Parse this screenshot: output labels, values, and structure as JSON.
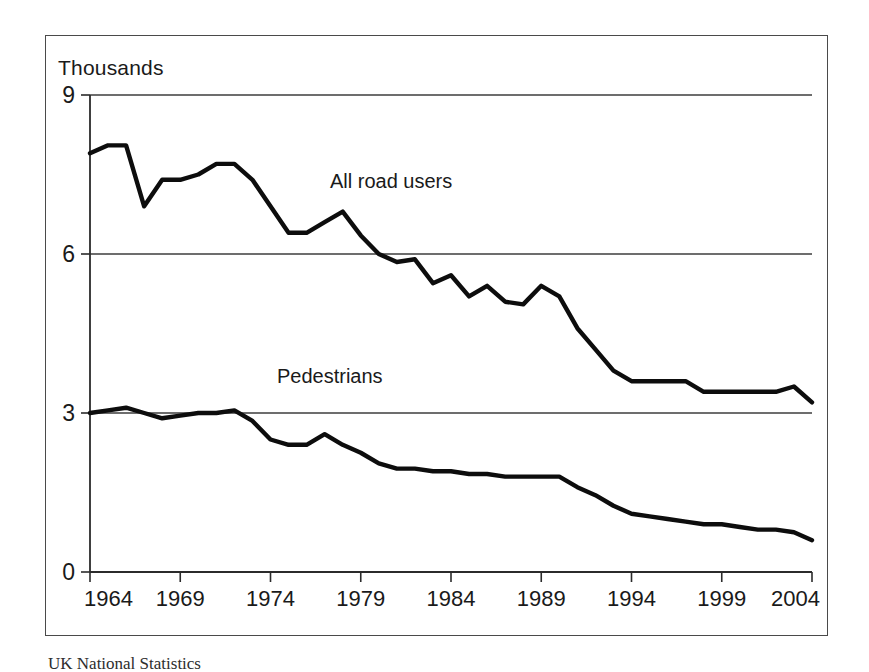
{
  "figure": {
    "unit_label": "Thousands",
    "caption": "UK National Statistics"
  },
  "labels": {
    "all_road_users": "All road users",
    "pedestrians": "Pedestrians"
  },
  "axis": {
    "y_ticks": [
      "0",
      "3",
      "6",
      "9"
    ],
    "x_ticks": [
      "1964",
      "1969",
      "1974",
      "1979",
      "1984",
      "1989",
      "1994",
      "1999",
      "2004"
    ]
  },
  "chart_data": {
    "type": "line",
    "title": "",
    "subtitle": "",
    "xlabel": "",
    "ylabel": "Thousands",
    "xlim": [
      1964,
      2004
    ],
    "ylim": [
      0,
      9
    ],
    "grid": true,
    "legend_position": "inline-annotations",
    "x_tick_labels": [
      "1964",
      "1969",
      "1974",
      "1979",
      "1984",
      "1989",
      "1994",
      "1999",
      "2004"
    ],
    "y_tick_labels": [
      "0",
      "3",
      "6",
      "9"
    ],
    "x": [
      1964,
      1965,
      1966,
      1967,
      1968,
      1969,
      1970,
      1971,
      1972,
      1973,
      1974,
      1975,
      1976,
      1977,
      1978,
      1979,
      1980,
      1981,
      1982,
      1983,
      1984,
      1985,
      1986,
      1987,
      1988,
      1989,
      1990,
      1991,
      1992,
      1993,
      1994,
      1995,
      1996,
      1997,
      1998,
      1999,
      2000,
      2001,
      2002,
      2003,
      2004
    ],
    "series": [
      {
        "name": "All road users",
        "annotation": "All road users",
        "values": [
          7.9,
          8.05,
          8.05,
          6.9,
          7.4,
          7.4,
          7.5,
          7.7,
          7.7,
          7.4,
          6.9,
          6.4,
          6.4,
          6.6,
          6.8,
          6.35,
          6.0,
          5.85,
          5.9,
          5.45,
          5.6,
          5.2,
          5.4,
          5.1,
          5.05,
          5.4,
          5.2,
          4.6,
          4.2,
          3.8,
          3.6,
          3.6,
          3.6,
          3.6,
          3.4,
          3.4,
          3.4,
          3.4,
          3.4,
          3.5,
          3.2
        ]
      },
      {
        "name": "Pedestrians",
        "annotation": "Pedestrians",
        "values": [
          3.0,
          3.05,
          3.1,
          3.0,
          2.9,
          2.95,
          3.0,
          3.0,
          3.05,
          2.85,
          2.5,
          2.4,
          2.4,
          2.6,
          2.4,
          2.25,
          2.05,
          1.95,
          1.95,
          1.9,
          1.9,
          1.85,
          1.85,
          1.8,
          1.8,
          1.8,
          1.8,
          1.6,
          1.45,
          1.25,
          1.1,
          1.05,
          1.0,
          0.95,
          0.9,
          0.9,
          0.85,
          0.8,
          0.8,
          0.75,
          0.6
        ]
      }
    ]
  }
}
